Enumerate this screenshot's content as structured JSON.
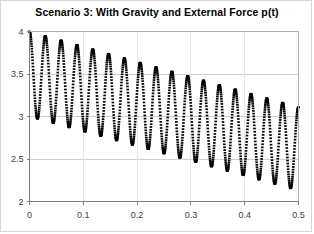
{
  "chart_data": {
    "type": "scatter",
    "title": "Scenario 3: With Gravity and External Force p(t)",
    "xlabel": "",
    "ylabel": "",
    "xlim": [
      0,
      0.5
    ],
    "ylim": [
      2,
      4
    ],
    "xticks": [
      "0",
      "0.1",
      "0.2",
      "0.3",
      "0.4",
      "0.5"
    ],
    "xtick_values": [
      0,
      0.1,
      0.2,
      0.3,
      0.4,
      0.5
    ],
    "yticks": [
      "2",
      "2.5",
      "3",
      "3.5",
      "4"
    ],
    "ytick_values": [
      2,
      2.5,
      3,
      3.5,
      4
    ],
    "grid": true,
    "grid_color": "#d0d0d0",
    "legend": null,
    "marker_color": "#000000",
    "marker": "dot",
    "series": [
      {
        "name": "displacement",
        "description": "Damped oscillation about a linearly decreasing mean; mean falls from about 3.5 at t=0 to about 2.6 at t=0.5 while the amplitude decays from about 0.5 to about 0.5.",
        "model": {
          "mean_start": 3.5,
          "mean_end": 2.62,
          "amplitude_start": 0.5,
          "amplitude_end": 0.49,
          "cycles": 17,
          "phase_cos": 1
        },
        "x": [
          0,
          0.0147,
          0.0294,
          0.0441,
          0.0588,
          0.0735,
          0.0882,
          0.1029,
          0.1176,
          0.1324,
          0.1471,
          0.1618,
          0.1765,
          0.1912,
          0.2059,
          0.2206,
          0.2353,
          0.25,
          0.2647,
          0.2794,
          0.2941,
          0.3088,
          0.3235,
          0.3382,
          0.3529,
          0.3676,
          0.3824,
          0.3971,
          0.4118,
          0.4265,
          0.4412,
          0.4559,
          0.4706,
          0.4853,
          0.5
        ],
        "y": [
          4.0,
          3.0,
          3.95,
          2.97,
          3.9,
          2.92,
          3.85,
          2.87,
          3.8,
          2.83,
          3.76,
          2.78,
          3.71,
          2.73,
          3.66,
          2.68,
          3.61,
          2.63,
          3.56,
          2.58,
          3.51,
          2.54,
          3.47,
          2.49,
          3.42,
          2.44,
          3.37,
          2.39,
          3.32,
          2.34,
          3.27,
          2.29,
          3.22,
          2.25,
          3.12
        ],
        "peaks": [
          4.0,
          3.95,
          3.9,
          3.85,
          3.8,
          3.76,
          3.71,
          3.66,
          3.61,
          3.56,
          3.51,
          3.47,
          3.42,
          3.37,
          3.32,
          3.27,
          3.12
        ],
        "troughs": [
          3.0,
          2.97,
          2.92,
          2.87,
          2.83,
          2.78,
          2.73,
          2.68,
          2.63,
          2.58,
          2.54,
          2.49,
          2.44,
          2.39,
          2.34,
          2.29,
          2.1
        ]
      }
    ]
  }
}
